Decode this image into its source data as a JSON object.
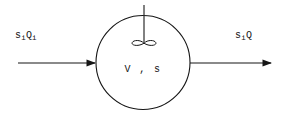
{
  "figure": {
    "type": "process-flow-diagram",
    "background_color": "#ffffff",
    "stroke_color": "#161616",
    "text_color": "#161616"
  },
  "inlet": {
    "label_plain": "siQi",
    "symbol": "s",
    "symbol_subscript": "i",
    "quantity": "Q",
    "quantity_subscript": "i",
    "arrow_direction": "right"
  },
  "outlet": {
    "label_plain": "siQ",
    "symbol": "s",
    "symbol_subscript": "i",
    "quantity": "Q",
    "quantity_subscript": "",
    "arrow_direction": "right"
  },
  "tank": {
    "contents_label": "V , s",
    "volume_symbol": "V",
    "separator": ",",
    "concentration_symbol": "s",
    "shape": "circle"
  },
  "stirrer": {
    "name": "impeller",
    "shaft_label": "",
    "blades": 2
  }
}
